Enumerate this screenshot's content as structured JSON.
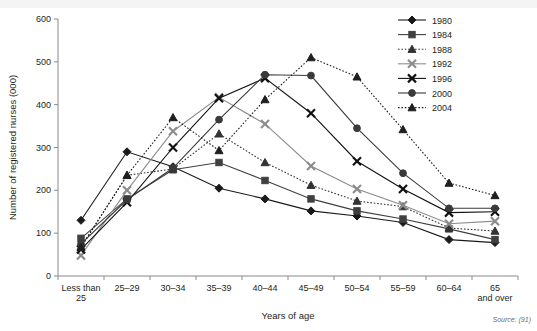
{
  "chart_data": {
    "type": "line",
    "title": "",
    "xlabel": "Years of age",
    "ylabel": "Number of registered nurses (000)",
    "ylim": [
      0,
      600
    ],
    "yticks": [
      0,
      100,
      200,
      300,
      400,
      500,
      600
    ],
    "grid": false,
    "legend_position": "top-right",
    "categories": [
      "Less than 25",
      "25–29",
      "30–34",
      "35–39",
      "40–44",
      "45–49",
      "50–54",
      "55–59",
      "60–64",
      "65 and over"
    ],
    "category_lines": [
      [
        "Less than",
        "25"
      ],
      [
        "25–29"
      ],
      [
        "30–34"
      ],
      [
        "35–39"
      ],
      [
        "40–44"
      ],
      [
        "45–49"
      ],
      [
        "50–54"
      ],
      [
        "55–59"
      ],
      [
        "60–64"
      ],
      [
        "65",
        "and over"
      ]
    ],
    "series": [
      {
        "name": "1980",
        "marker": "diamond",
        "dash": "solid",
        "color": "#1a1a1a",
        "values": [
          130,
          290,
          255,
          205,
          180,
          152,
          140,
          125,
          85,
          78
        ]
      },
      {
        "name": "1984",
        "marker": "square",
        "dash": "solid",
        "color": "#404040",
        "values": [
          88,
          180,
          248,
          265,
          223,
          180,
          152,
          133,
          110,
          85
        ]
      },
      {
        "name": "1988",
        "marker": "triangle",
        "dash": "dotted",
        "color": "#333333",
        "values": [
          68,
          235,
          250,
          332,
          265,
          212,
          175,
          162,
          112,
          105
        ]
      },
      {
        "name": "1992",
        "marker": "cross",
        "dash": "solid",
        "color": "#8c8c8c",
        "values": [
          48,
          200,
          338,
          417,
          355,
          257,
          203,
          165,
          122,
          128
        ]
      },
      {
        "name": "1996",
        "marker": "cross",
        "dash": "solid",
        "color": "#111111",
        "values": [
          62,
          172,
          300,
          415,
          462,
          380,
          268,
          203,
          148,
          150
        ]
      },
      {
        "name": "2000",
        "marker": "circle",
        "dash": "solid",
        "color": "#3a3a3a",
        "values": [
          75,
          178,
          252,
          365,
          470,
          468,
          345,
          240,
          158,
          158
        ]
      },
      {
        "name": "2004",
        "marker": "triangle",
        "dash": "dotted",
        "color": "#1f1f1f",
        "values": [
          67,
          235,
          370,
          293,
          412,
          510,
          465,
          342,
          217,
          188
        ]
      }
    ]
  },
  "source": {
    "note": "Source: (91)"
  }
}
